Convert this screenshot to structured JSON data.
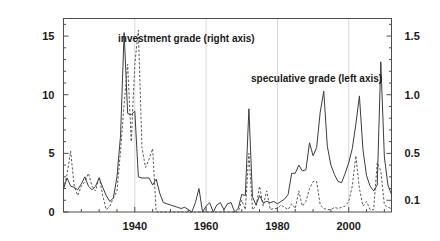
{
  "chart_data": {
    "type": "line",
    "title": "",
    "subtitle": "",
    "xlabel": "",
    "ylabel": "",
    "y2label": "",
    "grid": true,
    "legend_position": "inline-annotations",
    "xlim": [
      1920,
      2012
    ],
    "ylim": [
      0,
      16.5
    ],
    "y2lim": [
      0,
      1.65
    ],
    "xticks": [
      1940,
      1960,
      1980,
      2000
    ],
    "xtick_labels": [
      "1940",
      "1960",
      "1980",
      "2000"
    ],
    "xminor_tick_step": 5,
    "yticks": [
      0,
      5,
      10,
      15
    ],
    "ytick_labels": [
      "0",
      "5",
      "10",
      "15"
    ],
    "y2ticks": [
      0.1,
      0.5,
      1.0,
      1.5
    ],
    "y2tick_labels": [
      "0.1",
      "0.5",
      "1.0",
      "1.5"
    ],
    "annotations": [
      {
        "text": "investment grade (right axis)",
        "x_px": 118,
        "y_px": 42,
        "series": "investment-grade"
      },
      {
        "text": "speculative grade (left axis)",
        "x_px": 251,
        "y_px": 82,
        "series": "speculative-grade"
      }
    ],
    "series": [
      {
        "name": "speculative grade (left axis)",
        "axis": "left",
        "style": "solid",
        "color": "#3c3c3c",
        "x": [
          1920,
          1921,
          1922,
          1923,
          1924,
          1925,
          1926,
          1927,
          1928,
          1929,
          1930,
          1931,
          1932,
          1933,
          1934,
          1935,
          1936,
          1937,
          1938,
          1939,
          1940,
          1941,
          1942,
          1943,
          1944,
          1945,
          1946,
          1947,
          1948,
          1949,
          1950,
          1951,
          1952,
          1953,
          1954,
          1955,
          1956,
          1957,
          1958,
          1959,
          1960,
          1961,
          1962,
          1963,
          1964,
          1965,
          1966,
          1967,
          1968,
          1969,
          1970,
          1971,
          1972,
          1973,
          1974,
          1975,
          1976,
          1977,
          1978,
          1979,
          1980,
          1981,
          1982,
          1983,
          1984,
          1985,
          1986,
          1987,
          1988,
          1989,
          1990,
          1991,
          1992,
          1993,
          1994,
          1995,
          1996,
          1997,
          1998,
          1999,
          2000,
          2001,
          2002,
          2003,
          2004,
          2005,
          2006,
          2007,
          2008,
          2009,
          2010,
          2011,
          2012
        ],
        "y": [
          2.0,
          2.9,
          2.2,
          2.1,
          1.9,
          2.4,
          3.0,
          2.2,
          1.9,
          2.2,
          2.9,
          2.1,
          1.4,
          0.9,
          1.2,
          3.0,
          6.5,
          15.3,
          8.4,
          8.3,
          8.6,
          3.0,
          2.9,
          2.9,
          2.9,
          2.3,
          2.8,
          1.6,
          0.8,
          0.7,
          0.6,
          0.5,
          0.4,
          0.3,
          0.4,
          0.2,
          0.0,
          0.8,
          2.0,
          0.0,
          0.5,
          0.8,
          0.0,
          0.6,
          0.8,
          0.2,
          0.7,
          0.8,
          0.0,
          0.3,
          1.5,
          1.4,
          8.8,
          1.3,
          0.6,
          1.4,
          0.8,
          0.9,
          0.8,
          0.9,
          0.7,
          0.9,
          1.1,
          1.5,
          3.3,
          3.3,
          4.0,
          3.5,
          3.6,
          5.9,
          4.8,
          5.5,
          8.5,
          10.3,
          5.6,
          4.0,
          3.2,
          2.6,
          2.5,
          3.3,
          4.2,
          5.4,
          7.5,
          9.9,
          5.3,
          3.1,
          2.2,
          1.8,
          2.3,
          12.8,
          4.7,
          2.3,
          1.5
        ]
      },
      {
        "name": "investment grade (right axis)",
        "axis": "right",
        "style": "dashed",
        "color": "#5a5a5a",
        "x": [
          1920,
          1921,
          1922,
          1923,
          1924,
          1925,
          1926,
          1927,
          1928,
          1929,
          1930,
          1931,
          1932,
          1933,
          1934,
          1935,
          1936,
          1937,
          1938,
          1939,
          1940,
          1941,
          1942,
          1943,
          1944,
          1945,
          1946,
          1947,
          1948,
          1949,
          1950,
          1951,
          1952,
          1953,
          1954,
          1955,
          1956,
          1957,
          1958,
          1959,
          1960,
          1961,
          1962,
          1963,
          1964,
          1965,
          1966,
          1967,
          1968,
          1969,
          1970,
          1971,
          1972,
          1973,
          1974,
          1975,
          1976,
          1977,
          1978,
          1979,
          1980,
          1981,
          1982,
          1983,
          1984,
          1985,
          1986,
          1987,
          1988,
          1989,
          1990,
          1991,
          1992,
          1993,
          1994,
          1995,
          1996,
          1997,
          1998,
          1999,
          2000,
          2001,
          2002,
          2003,
          2004,
          2005,
          2006,
          2007,
          2008,
          2009,
          2010,
          2011,
          2012
        ],
        "y": [
          0.2,
          0.32,
          0.52,
          0.22,
          0.14,
          0.22,
          0.26,
          0.33,
          0.22,
          0.18,
          0.3,
          0.14,
          0.02,
          0.05,
          0.12,
          0.18,
          0.52,
          0.92,
          1.26,
          0.6,
          1.26,
          1.55,
          0.55,
          0.38,
          0.45,
          0.54,
          0.0,
          0.0,
          0.0,
          0.0,
          0.0,
          0.0,
          0.0,
          0.0,
          0.0,
          0.0,
          0.0,
          0.0,
          0.0,
          0.0,
          0.0,
          0.0,
          0.0,
          0.0,
          0.0,
          0.0,
          0.0,
          0.0,
          0.0,
          0.0,
          0.1,
          0.02,
          0.5,
          0.02,
          0.05,
          0.22,
          0.05,
          0.18,
          0.02,
          0.03,
          0.03,
          0.06,
          0.04,
          0.02,
          0.07,
          0.03,
          0.18,
          0.05,
          0.09,
          0.2,
          0.26,
          0.26,
          0.06,
          0.03,
          0.02,
          0.02,
          0.04,
          0.03,
          0.04,
          0.05,
          0.09,
          0.22,
          0.48,
          0.2,
          0.05,
          0.09,
          0.02,
          0.02,
          0.42,
          0.35,
          0.06,
          0.04,
          0.03
        ]
      }
    ]
  },
  "axes": {
    "left_axis_name": "speculative grade default rate (percent)",
    "right_axis_name": "investment grade default rate (percent)"
  }
}
